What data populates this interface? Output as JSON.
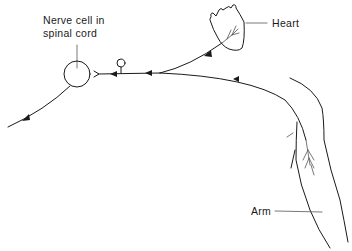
{
  "diagram": {
    "labels": {
      "nerve_cell": "Nerve cell in\nspinal cord",
      "nerve_cell_line1": "Nerve cell in",
      "nerve_cell_line2": "spinal cord",
      "heart": "Heart",
      "arm": "Arm"
    },
    "elements": [
      {
        "id": "nerve-cell",
        "shape": "circle",
        "label": "Nerve cell in spinal cord"
      },
      {
        "id": "heart",
        "shape": "heart-outline",
        "label": "Heart"
      },
      {
        "id": "arm",
        "shape": "arm-outline",
        "label": "Arm"
      },
      {
        "id": "synapse-knob",
        "shape": "small-circle-on-stalk"
      },
      {
        "id": "heart-nerve",
        "shape": "curve-with-arrow",
        "direction": "heart-to-spinal-cord"
      },
      {
        "id": "arm-nerve",
        "shape": "curve-with-arrows",
        "direction": "arm-to-spinal-cord"
      },
      {
        "id": "output-nerve",
        "shape": "curve-with-arrow",
        "direction": "spinal-cord-outward"
      }
    ],
    "colors": {
      "line": "#1a1a1a",
      "background": "#ffffff"
    }
  }
}
